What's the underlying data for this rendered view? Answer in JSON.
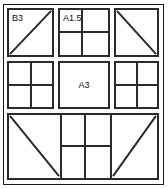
{
  "diagram": {
    "type": "quilt-block-layout",
    "background_color": "#ffffff",
    "line_color": "#2b2b2b",
    "frame_color": "#1a1a1a",
    "text_color": "#111111",
    "rows": 3,
    "blocks": [
      {
        "id": "top-left",
        "label": "B3",
        "label_position": "top-left",
        "pattern": "half-square-triangle",
        "diagonal": "bottom-left-to-top-right"
      },
      {
        "id": "top-center",
        "label": "A1.5",
        "label_position": "top-left",
        "pattern": "four-patch",
        "diagonal": "none"
      },
      {
        "id": "top-right",
        "label": "",
        "label_position": "none",
        "pattern": "half-square-triangle",
        "diagonal": "top-left-to-bottom-right"
      },
      {
        "id": "middle-left",
        "label": "",
        "label_position": "none",
        "pattern": "four-patch",
        "diagonal": "none"
      },
      {
        "id": "middle-center",
        "label": "A3",
        "label_position": "center",
        "pattern": "plain-square",
        "diagonal": "none"
      },
      {
        "id": "middle-right",
        "label": "",
        "label_position": "none",
        "pattern": "four-patch",
        "diagonal": "none"
      },
      {
        "id": "bottom-band-left",
        "label": "",
        "label_position": "none",
        "pattern": "half-rectangle-triangle",
        "diagonal": "top-left-to-bottom-right"
      },
      {
        "id": "bottom-band-center",
        "label": "",
        "label_position": "none",
        "pattern": "four-patch",
        "diagonal": "none"
      },
      {
        "id": "bottom-band-right",
        "label": "",
        "label_position": "none",
        "pattern": "half-rectangle-triangle",
        "diagonal": "bottom-left-to-top-right"
      }
    ]
  }
}
